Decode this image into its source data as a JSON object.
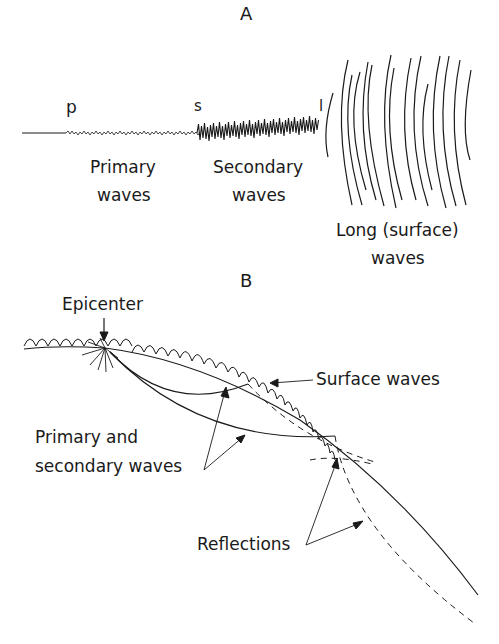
{
  "panel_a": {
    "letter": "A",
    "markers": {
      "p": "p",
      "s": "s",
      "l": "l"
    },
    "labels": {
      "primary_line1": "Primary",
      "primary_line2": "waves",
      "secondary_line1": "Secondary",
      "secondary_line2": "waves",
      "long_line1": "Long (surface)",
      "long_line2": "waves"
    }
  },
  "panel_b": {
    "letter": "B",
    "labels": {
      "epicenter": "Epicenter",
      "surface_waves": "Surface waves",
      "pswaves_line1": "Primary and",
      "pswaves_line2": "secondary waves",
      "reflections": "Reflections"
    }
  },
  "colors": {
    "ink": "#1a1a1a",
    "background": "#ffffff"
  }
}
